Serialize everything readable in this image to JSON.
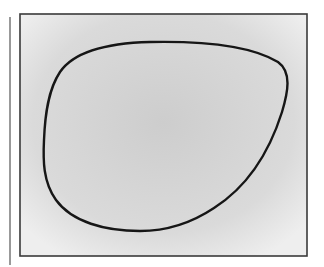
{
  "figure": {
    "colors": {
      "page_background": "#ffffff",
      "frame_fill_center": "#cfcfcf",
      "frame_fill_edge": "#ececec",
      "frame_border": "#3a3a3a",
      "curve_stroke": "#161616",
      "side_line": "#555555"
    },
    "frame": {
      "x": 20,
      "y": 14,
      "width": 287,
      "height": 242
    },
    "side_line": {
      "x": 10,
      "y1": 17,
      "y2": 265
    },
    "shape_path": "M 150 42 C 200 41 250 45 278 62 C 292 72 288 92 282 112 C 270 150 250 185 214 208 C 190 224 165 231 140 231 C 105 231 72 222 56 200 C 43 182 43 160 44 140 C 45 115 48 90 60 72 C 75 50 110 43 150 42 Z"
  }
}
